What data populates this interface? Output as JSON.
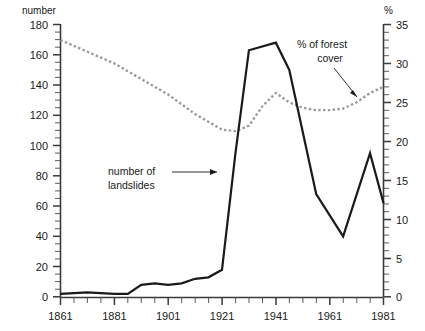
{
  "chart_data": {
    "type": "line",
    "title": "",
    "xlabel": "",
    "ylabel": "number",
    "y2label": "%",
    "xlim": [
      1861,
      1981
    ],
    "ylim": [
      0,
      180
    ],
    "y2lim": [
      0,
      35
    ],
    "grid": false,
    "legend_position": "inline-annotations",
    "x_ticks": [
      1861,
      1881,
      1901,
      1921,
      1941,
      1961,
      1981
    ],
    "x_tick_labels": [
      "1861",
      "1881",
      "1901",
      "1921",
      "1941",
      "1961",
      "1981"
    ],
    "x_minor_step": 5,
    "y_ticks": [
      0,
      20,
      40,
      60,
      80,
      100,
      120,
      140,
      160,
      180
    ],
    "y_tick_labels": [
      "0",
      "20",
      "40",
      "60",
      "80",
      "100",
      "120",
      "140",
      "160",
      "180"
    ],
    "y_minor_step": 5,
    "y2_ticks": [
      0,
      5,
      10,
      15,
      20,
      25,
      30,
      35
    ],
    "y2_tick_labels": [
      "0",
      "5",
      "10",
      "15",
      "20",
      "25",
      "30",
      "35"
    ],
    "y2_minor_step": 1,
    "series": [
      {
        "name": "number of landslides",
        "axis": "left",
        "style": "solid",
        "color": "#1a1a1a",
        "x": [
          1861,
          1871,
          1881,
          1886,
          1891,
          1896,
          1901,
          1906,
          1911,
          1916,
          1921,
          1926,
          1931,
          1941,
          1946,
          1956,
          1966,
          1976,
          1981
        ],
        "values": [
          2,
          3,
          2,
          2,
          8,
          9,
          8,
          9,
          12,
          13,
          18,
          95,
          163,
          168,
          150,
          68,
          40,
          95,
          62
        ]
      },
      {
        "name": "% of forest cover",
        "axis": "right",
        "style": "dashed",
        "color": "#9a9a9a",
        "x": [
          1861,
          1871,
          1881,
          1891,
          1901,
          1911,
          1921,
          1926,
          1931,
          1936,
          1941,
          1946,
          1951,
          1956,
          1961,
          1966,
          1971,
          1976,
          1981
        ],
        "values": [
          33.0,
          31.5,
          30.0,
          28.0,
          26.0,
          23.5,
          21.5,
          21.3,
          22.0,
          24.5,
          26.2,
          25.0,
          24.3,
          24.0,
          24.0,
          24.2,
          25.0,
          26.2,
          27.0
        ]
      }
    ],
    "annotations": [
      {
        "name": "landslides-label",
        "text_line1": "number of",
        "text_line2": "landslides"
      },
      {
        "name": "forest-cover-label",
        "text_line1": "% of forest",
        "text_line2": "cover"
      }
    ]
  }
}
